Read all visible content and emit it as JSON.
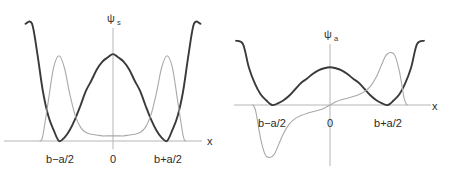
{
  "figure": {
    "background_color": "#ffffff",
    "axis_color": "#b6b6b6",
    "potential_color": "#3a3a3a",
    "wavefunction_color": "#a9a9a9",
    "label_color": "#2b2b2b"
  },
  "panels": [
    {
      "id": "panel-left",
      "title": "ψ",
      "title_subscript": "s",
      "xaxis_label": "x",
      "tick_labels": [
        {
          "text": "b−a/2",
          "x_px": 60
        },
        {
          "text": "0",
          "x_px": 113
        },
        {
          "text": "b+a/2",
          "x_px": 168
        }
      ],
      "origin_px": {
        "x": 113,
        "y": 141
      },
      "chart_data": {
        "type": "line",
        "title": "ψs",
        "xlabel": "x",
        "ylabel": "ψs",
        "grid": false,
        "legend": "none",
        "xlim": [
          -1.95,
          1.95
        ],
        "ylim": [
          -0.12,
          1.35
        ],
        "xticks": [
          -1,
          0,
          1
        ],
        "xticklabels": [
          "b−a/2",
          "0",
          "b+a/2"
        ],
        "series": [
          {
            "name": "double-well potential",
            "color": "#3a3a3a",
            "kind": "potential",
            "formula": "V(x) = k*(x^2 - 1)^2",
            "k": 1.02,
            "wells": [
              -1,
              1
            ],
            "barrier_height": 1.02,
            "x": [
              -1.62,
              -1.5,
              -1.4,
              -1.3,
              -1.2,
              -1.1,
              -1.0,
              -0.9,
              -0.8,
              -0.7,
              -0.6,
              -0.5,
              -0.4,
              -0.3,
              -0.2,
              -0.1,
              0.0,
              0.1,
              0.2,
              0.3,
              0.4,
              0.5,
              0.6,
              0.7,
              0.8,
              0.9,
              1.0,
              1.1,
              1.2,
              1.3,
              1.4,
              1.5,
              1.62
            ],
            "y": [
              2.49,
              1.64,
              1.02,
              0.59,
              0.3,
              0.13,
              0.0,
              0.04,
              0.13,
              0.26,
              0.42,
              0.59,
              0.71,
              0.84,
              0.93,
              0.98,
              1.02,
              0.98,
              0.93,
              0.84,
              0.71,
              0.59,
              0.42,
              0.26,
              0.13,
              0.04,
              0.0,
              0.13,
              0.3,
              0.59,
              1.02,
              1.64,
              2.49
            ]
          },
          {
            "name": "symmetric wavefunction",
            "color": "#a9a9a9",
            "kind": "wavefunction",
            "symmetry": "symmetric",
            "nodes": 0,
            "peaks_at": [
              -1,
              1
            ],
            "x": [
              -1.35,
              -1.3,
              -1.2,
              -1.1,
              -1.0,
              -0.9,
              -0.8,
              -0.7,
              -0.6,
              -0.5,
              -0.4,
              -0.3,
              -0.2,
              -0.1,
              0.0,
              0.1,
              0.2,
              0.3,
              0.4,
              0.5,
              0.6,
              0.7,
              0.8,
              0.9,
              1.0,
              1.1,
              1.2,
              1.3,
              1.35
            ],
            "y": [
              0.0,
              0.06,
              0.46,
              0.86,
              1.0,
              0.86,
              0.55,
              0.3,
              0.16,
              0.1,
              0.08,
              0.07,
              0.06,
              0.06,
              0.06,
              0.06,
              0.06,
              0.07,
              0.08,
              0.1,
              0.16,
              0.3,
              0.55,
              0.86,
              1.0,
              0.86,
              0.46,
              0.06,
              0.0
            ]
          }
        ]
      }
    },
    {
      "id": "panel-right",
      "title": "ψ",
      "title_subscript": "a",
      "xaxis_label": "x",
      "tick_labels": [
        {
          "text": "b−a/2",
          "x_px": 42
        },
        {
          "text": "0",
          "x_px": 100
        },
        {
          "text": "b+a/2",
          "x_px": 158
        }
      ],
      "origin_px": {
        "x": 100,
        "y": 105
      },
      "chart_data": {
        "type": "line",
        "title": "ψa",
        "xlabel": "x",
        "ylabel": "ψa",
        "grid": false,
        "legend": "none",
        "xlim": [
          -1.95,
          1.95
        ],
        "ylim": [
          -1.2,
          1.2
        ],
        "xticks": [
          -1,
          0,
          1
        ],
        "xticklabels": [
          "b−a/2",
          "0",
          "b+a/2"
        ],
        "series": [
          {
            "name": "double-well potential",
            "color": "#3a3a3a",
            "kind": "potential",
            "formula": "V(x) = k*(x^2 - 1)^2",
            "k": 0.72,
            "wells": [
              -1,
              1
            ],
            "barrier_height": 0.72,
            "x": [
              -1.62,
              -1.5,
              -1.4,
              -1.3,
              -1.2,
              -1.1,
              -1.0,
              -0.9,
              -0.8,
              -0.7,
              -0.6,
              -0.5,
              -0.4,
              -0.3,
              -0.2,
              -0.1,
              0.0,
              0.1,
              0.2,
              0.3,
              0.4,
              0.5,
              0.6,
              0.7,
              0.8,
              0.9,
              1.0,
              1.1,
              1.2,
              1.3,
              1.4,
              1.5,
              1.62
            ],
            "y": [
              1.76,
              1.16,
              0.72,
              0.42,
              0.21,
              0.09,
              0.0,
              0.03,
              0.09,
              0.18,
              0.3,
              0.42,
              0.5,
              0.59,
              0.66,
              0.7,
              0.72,
              0.7,
              0.66,
              0.59,
              0.5,
              0.42,
              0.3,
              0.18,
              0.09,
              0.03,
              0.0,
              0.09,
              0.21,
              0.42,
              0.72,
              1.16,
              1.76
            ]
          },
          {
            "name": "antisymmetric wavefunction",
            "color": "#a9a9a9",
            "kind": "wavefunction",
            "symmetry": "antisymmetric",
            "nodes": 1,
            "node_at": 0,
            "extrema_at": [
              -1,
              1
            ],
            "x": [
              -1.33,
              -1.28,
              -1.2,
              -1.12,
              -1.05,
              -1.0,
              -0.95,
              -0.88,
              -0.8,
              -0.7,
              -0.6,
              -0.5,
              -0.4,
              -0.3,
              -0.2,
              -0.1,
              0.0,
              0.1,
              0.2,
              0.3,
              0.4,
              0.5,
              0.6,
              0.7,
              0.8,
              0.88,
              0.95,
              1.0,
              1.05,
              1.12,
              1.2,
              1.28,
              1.33
            ],
            "y": [
              0.0,
              -0.12,
              -0.62,
              -0.94,
              -1.0,
              -0.98,
              -0.92,
              -0.74,
              -0.54,
              -0.36,
              -0.26,
              -0.2,
              -0.16,
              -0.13,
              -0.1,
              -0.06,
              0.0,
              0.06,
              0.1,
              0.13,
              0.16,
              0.2,
              0.26,
              0.36,
              0.54,
              0.74,
              0.92,
              0.98,
              1.0,
              0.94,
              0.62,
              0.12,
              0.0
            ]
          }
        ]
      }
    }
  ]
}
